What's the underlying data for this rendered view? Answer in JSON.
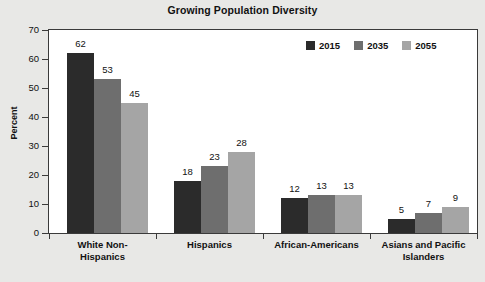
{
  "chart_data": {
    "type": "bar",
    "title": "Growing Population Diversity",
    "xlabel": "",
    "ylabel": "Percent",
    "ylim": [
      0,
      70
    ],
    "ytick_step": 10,
    "yticks": [
      70,
      60,
      50,
      40,
      30,
      20,
      10,
      0
    ],
    "grid": false,
    "legend_position": "top-right-inside",
    "categories": [
      "White Non-Hispanics",
      "Hispanics",
      "African-Americans",
      "Asians and Pacific Islanders"
    ],
    "category_lines": [
      [
        "White Non-",
        "Hispanics"
      ],
      [
        "Hispanics"
      ],
      [
        "African-Americans"
      ],
      [
        "Asians and Pacific",
        "Islanders"
      ]
    ],
    "series": [
      {
        "name": "2015",
        "color": "#2b2b2b",
        "values": [
          62,
          18,
          12,
          5
        ]
      },
      {
        "name": "2035",
        "color": "#6e6e6e",
        "values": [
          53,
          23,
          13,
          7
        ]
      },
      {
        "name": "2055",
        "color": "#a5a5a5",
        "values": [
          45,
          28,
          13,
          9
        ]
      }
    ]
  },
  "colors": {
    "page_background": "#e8e8e6",
    "plot_background": "#ffffff",
    "axis": "#3a3a3a",
    "text": "#111111",
    "series_2015": "#2b2b2b",
    "series_2035": "#6e6e6e",
    "series_2055": "#a5a5a5"
  }
}
